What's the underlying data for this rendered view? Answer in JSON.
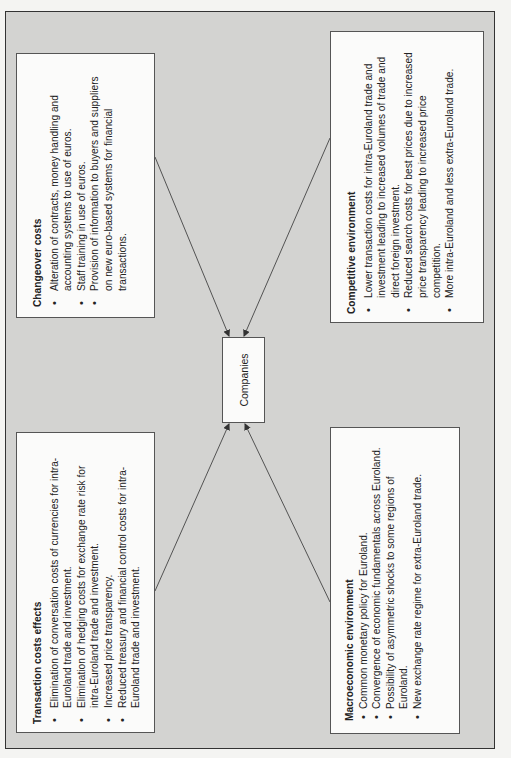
{
  "diagram": {
    "center": {
      "label": "Companies"
    },
    "boxes": {
      "changeover": {
        "title": "Changeover costs",
        "items": [
          "Alteration of contracts, money handling and accounting systems to use of euros.",
          "Staff training in use of euros.",
          "Provision of information to buyers and suppliers on new euro-based systems for financial transactions."
        ]
      },
      "competitive": {
        "title": "Competitive environment",
        "items": [
          "Lower transaction costs for intra-Euroland trade and investment leading to increased volumes of trade and direct foreign investment.",
          "Reduced search costs for best prices due to increased price transparency leading to increased price competition.",
          "More intra-Euroland and less extra-Euroland trade."
        ]
      },
      "transaction": {
        "title": "Transaction costs effects",
        "items": [
          "Elimination of conversation costs of currencies for intra-Euroland trade and investment.",
          "Elimination of hedging costs for exchange rate risk for intra-Euroland trade and investment.",
          "Increased price transparency.",
          "Reduced treasury and financial control costs for intra-Euroland trade and investment."
        ]
      },
      "macro": {
        "title": "Macroeconomic environment",
        "items": [
          "Common monetary policy for Euroland.",
          "Convergence of economic fundamentals across Euroland.",
          "Possibility of asymmetric shocks to some regions of Euroland.",
          "New exchange rate regime for extra-Euroland trade."
        ]
      }
    },
    "arrows": [
      {
        "from": "changeover",
        "x1": 155,
        "y1": 157,
        "x2": 229,
        "y2": 337
      },
      {
        "from": "competitive",
        "x1": 330,
        "y1": 138,
        "x2": 244,
        "y2": 337
      },
      {
        "from": "transaction",
        "x1": 155,
        "y1": 591,
        "x2": 229,
        "y2": 423
      },
      {
        "from": "macro",
        "x1": 330,
        "y1": 602,
        "x2": 245,
        "y2": 423
      }
    ],
    "colors": {
      "frame_bg": "#d3d3d1",
      "box_bg": "#fbfbfa",
      "line": "#444444"
    }
  }
}
